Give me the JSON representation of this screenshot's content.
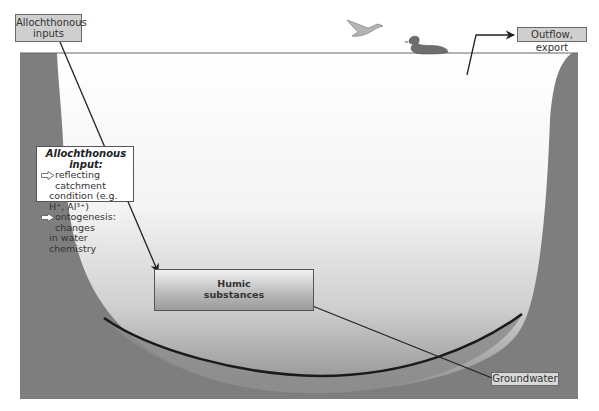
{
  "diagram": {
    "labels": {
      "allochthonous_inputs_line1": "Allochthonous",
      "allochthonous_inputs_line2": "inputs",
      "outflow": "Outflow, export",
      "groundwater": "Groundwater",
      "humic_line1": "Humic",
      "humic_line2": "substances"
    },
    "info_box": {
      "title": "Allochthonous input:",
      "item1_line1": "reflecting catchment",
      "item1_line2": "condition (e.g. H⁺, Al³⁺)",
      "item2_line1": "ontogenesis: changes",
      "item2_line2": "in water chemistry"
    },
    "icons": [
      "flying-bird-icon",
      "swimming-duck-icon",
      "hollow-arrow-icon"
    ],
    "colors": {
      "sediment": "#7f7f7f",
      "water_top": "#ffffff",
      "water_bottom": "#9e9e9e",
      "label_fill": "#cfcfcf",
      "line": "#222222"
    }
  }
}
